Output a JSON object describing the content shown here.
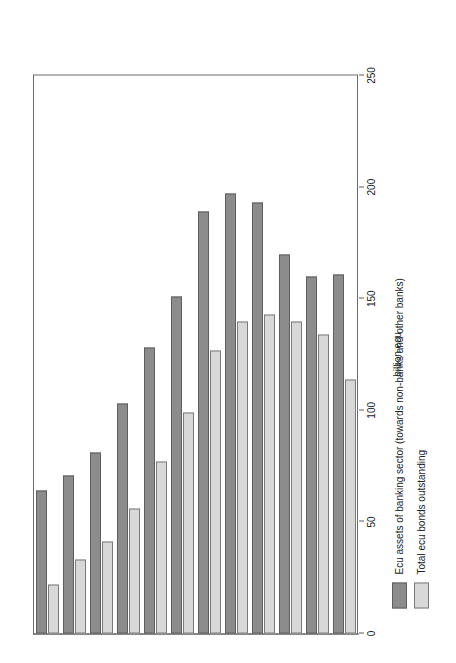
{
  "chart_data": {
    "type": "bar",
    "orientation": "horizontal",
    "title": "",
    "subtitle": "",
    "xlabel": "",
    "ylabel": "billion ecu",
    "ylim": [
      0,
      250
    ],
    "yticks": [
      0,
      50,
      100,
      150,
      200,
      250
    ],
    "ytick_labels": [
      "0",
      "50",
      "100",
      "150",
      "200",
      "250"
    ],
    "grid": false,
    "legend_position": "below-axis",
    "categories": [
      "1985",
      "1986",
      "1987",
      "1988",
      "1989",
      "1990",
      "1991",
      "1992",
      "1993",
      "1994",
      "1995",
      "1996"
    ],
    "series": [
      {
        "name": "Ecu assets of banking sector (towards non-banks and other banks)",
        "color": "#8c8c8c",
        "values": [
          64,
          71,
          81,
          103,
          128,
          151,
          189,
          197,
          193,
          170,
          160,
          161
        ]
      },
      {
        "name": "Total ecu bonds outstanding",
        "color": "#d8d8d8",
        "values": [
          22,
          33,
          41,
          56,
          77,
          99,
          127,
          140,
          143,
          140,
          134,
          114
        ]
      }
    ]
  },
  "axis": {
    "value_axis_title": "billion ecu"
  },
  "legend": {
    "entries": [
      {
        "label": "Ecu assets of banking sector (towards non-banks and other banks)",
        "swatch": "dark-gray-swatch"
      },
      {
        "label": "Total ecu bonds outstanding",
        "swatch": "light-gray-swatch"
      }
    ]
  }
}
